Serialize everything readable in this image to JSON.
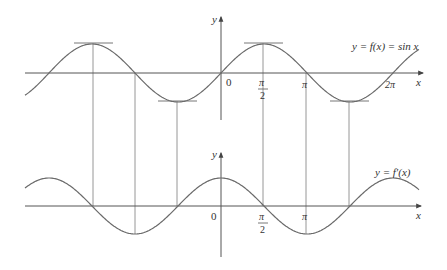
{
  "figure": {
    "top_plot": {
      "label": "y = f(x) = sin x",
      "y_axis_label": "y",
      "x_axis_label": "x",
      "origin_label": "0",
      "ticks": [
        {
          "num": "π",
          "den": "2",
          "value": "π/2"
        },
        {
          "num": "π",
          "den": "",
          "value": "π"
        },
        {
          "num": "2π",
          "den": "",
          "value": "2π"
        }
      ]
    },
    "bottom_plot": {
      "label": "y = f′(x)",
      "y_axis_label": "y",
      "x_axis_label": "x",
      "origin_label": "0",
      "ticks": [
        {
          "num": "π",
          "den": "2",
          "value": "π/2"
        },
        {
          "num": "π",
          "den": "",
          "value": "π"
        }
      ]
    },
    "colors": {
      "curve": "#6a6a6a",
      "axis": "#555555",
      "guide": "#888888"
    }
  }
}
